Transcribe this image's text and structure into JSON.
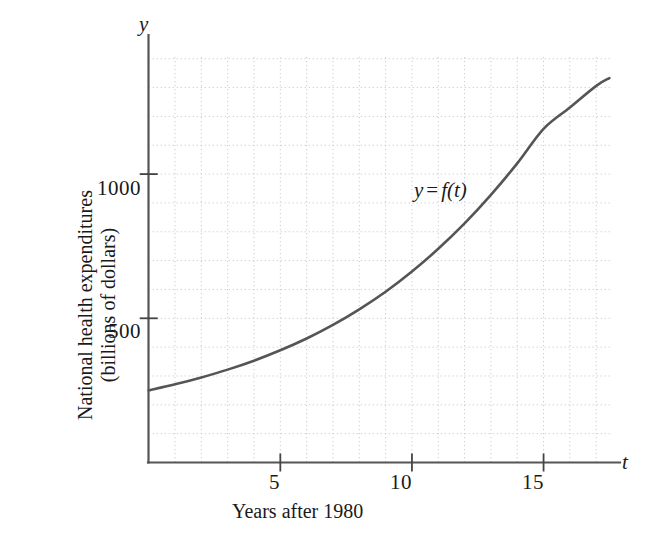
{
  "chart_data": {
    "type": "line",
    "title": "",
    "subtitle": "",
    "xlabel": "Years after 1980",
    "ylabel_line1": "National health expenditures",
    "ylabel_line2": "(billions of dollars)",
    "axis_symbol_x": "t",
    "axis_symbol_y": "y",
    "curve_annotation": {
      "lhs": "y",
      "op": "=",
      "rhs": "f(t)"
    },
    "xlim": [
      0,
      17.6
    ],
    "ylim": [
      0,
      1406
    ],
    "xticks": [
      5,
      10,
      15
    ],
    "xtick_labels": [
      "5",
      "10",
      "15"
    ],
    "yticks": [
      500,
      1000
    ],
    "ytick_labels": [
      "500",
      "1000"
    ],
    "grid": true,
    "grid_style": "dotted",
    "grid_x_step": 1,
    "grid_y_step": 100,
    "legend": "none",
    "series": [
      {
        "name": "y = f(t)",
        "color": "#555555",
        "x": [
          0,
          1,
          2,
          3,
          4,
          5,
          6,
          7,
          8,
          9,
          10,
          11,
          12,
          13,
          14,
          15,
          16,
          17,
          17.5
        ],
        "values": [
          250,
          271,
          295,
          322,
          353,
          389,
          430,
          477,
          531,
          592,
          662,
          741,
          829,
          928,
          1037,
          1157,
          1231,
          1306,
          1333
        ]
      }
    ]
  },
  "labels": {
    "ytick_1000": "1000",
    "ytick_500": "500",
    "xtick_5": "5",
    "xtick_10": "10",
    "xtick_15": "15",
    "y_axis_symbol": "y",
    "x_axis_symbol": "t",
    "fn_lhs": "y",
    "fn_op": "=",
    "fn_rhs": "f(t)",
    "x_caption": "Years after 1980",
    "y_caption_line1": "National health expenditures",
    "y_caption_line2": "(billions of dollars)"
  },
  "colors": {
    "curve": "#555555",
    "axis": "#444444",
    "grid": "#c9c9d6",
    "background": "#ffffff",
    "text": "#1a1a1a"
  }
}
